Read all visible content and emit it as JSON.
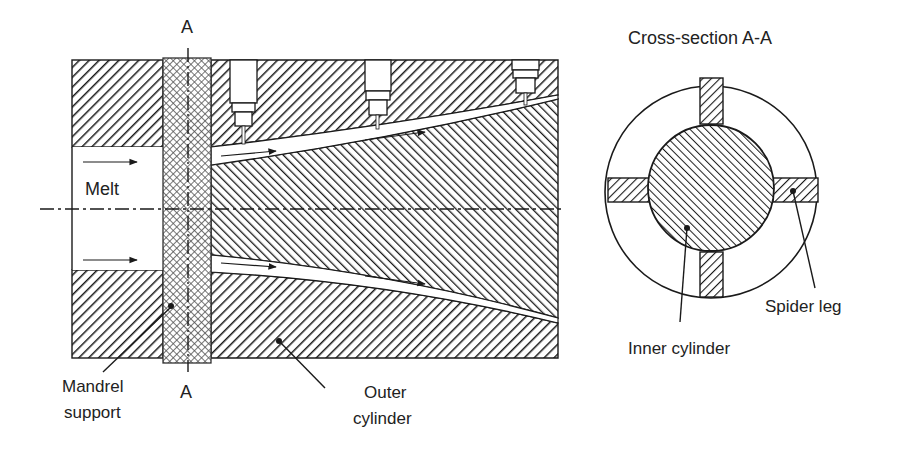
{
  "labels": {
    "section_top": "A",
    "section_bottom": "A",
    "melt": "Melt",
    "mandrel_support_line1": "Mandrel",
    "mandrel_support_line2": "support",
    "outer_cylinder_line1": "Outer",
    "outer_cylinder_line2": "cylinder",
    "cross_section_title": "Cross-section A-A",
    "spider_leg": "Spider leg",
    "inner_cylinder": "Inner cylinder"
  },
  "components": [
    {
      "name": "outer-cylinder",
      "fill": "diagonal-hatch-down"
    },
    {
      "name": "inner-cylinder",
      "fill": "diagonal-hatch-up"
    },
    {
      "name": "mandrel-support",
      "fill": "cross-hatch"
    },
    {
      "name": "pressure-sensors",
      "count": 3
    },
    {
      "name": "flow-arrows",
      "count": 6
    }
  ],
  "colors": {
    "line": "#1a1a1a",
    "background": "#ffffff"
  }
}
